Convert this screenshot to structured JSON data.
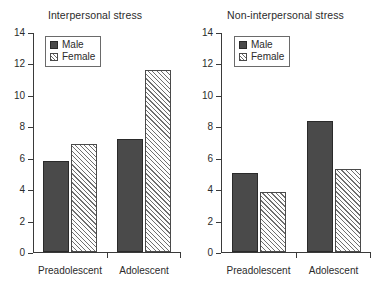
{
  "figure": {
    "background": "#ffffff",
    "axis_color": "#3a3a3a",
    "male_color": "#4a4a4a",
    "female_color": "#ffffff",
    "female_hatch_color": "#6e6e6e"
  },
  "legend": {
    "male_label": "Male",
    "female_label": "Female"
  },
  "chart_data": [
    {
      "type": "bar",
      "title": "Interpersonal stress",
      "xlabel": "",
      "ylabel": "",
      "ylim": [
        0,
        14
      ],
      "yticks": [
        0,
        2,
        4,
        6,
        8,
        10,
        12,
        14
      ],
      "ytick_labels": [
        "0",
        "2",
        "4",
        "6",
        "8",
        "10",
        "12",
        "14"
      ],
      "grid": false,
      "legend_position": "top-left",
      "categories": [
        "Preadolescent",
        "Adolescent"
      ],
      "series": [
        {
          "name": "Male",
          "values": [
            5.8,
            7.2
          ]
        },
        {
          "name": "Female",
          "values": [
            6.9,
            11.6
          ]
        }
      ]
    },
    {
      "type": "bar",
      "title": "Non-interpersonal stress",
      "xlabel": "",
      "ylabel": "",
      "ylim": [
        0,
        14
      ],
      "yticks": [
        0,
        2,
        4,
        6,
        8,
        10,
        12,
        14
      ],
      "ytick_labels": [
        "0",
        "2",
        "4",
        "6",
        "8",
        "10",
        "12",
        "14"
      ],
      "grid": false,
      "legend_position": "top-left",
      "categories": [
        "Preadolescent",
        "Adolescent"
      ],
      "series": [
        {
          "name": "Male",
          "values": [
            5.05,
            8.35
          ]
        },
        {
          "name": "Female",
          "values": [
            3.85,
            5.3
          ]
        }
      ]
    }
  ]
}
